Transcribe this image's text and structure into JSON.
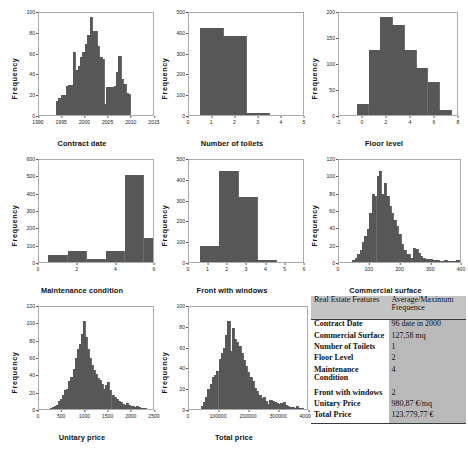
{
  "chart_data": [
    {
      "id": "contract-date",
      "type": "bar",
      "title": "",
      "xlabel": "Contract date",
      "ylabel": "Frequency",
      "ylim": [
        0,
        100
      ],
      "yticks": [
        0,
        20,
        40,
        60,
        80,
        100
      ],
      "xlim": [
        1990,
        2010
      ],
      "xticks": [
        "1990",
        "1995",
        "2000",
        "2005",
        "2010",
        "2015"
      ],
      "xtick_values": [
        1990,
        1994,
        1998,
        2002,
        2006,
        2010
      ],
      "grid": false,
      "bin_start": 1993.0,
      "bin_width": 0.42,
      "values": [
        14,
        17,
        20,
        20,
        28,
        29,
        29,
        62,
        44,
        48,
        57,
        62,
        70,
        78,
        96,
        82,
        82,
        68,
        57,
        55,
        11,
        27,
        27,
        27,
        28,
        42,
        58,
        35,
        30,
        22,
        21
      ]
    },
    {
      "id": "number-of-toilets",
      "type": "bar",
      "title": "",
      "xlabel": "Number of toilets",
      "ylabel": "Frequency",
      "ylim": [
        0,
        500
      ],
      "yticks": [
        0,
        100,
        200,
        300,
        400,
        500
      ],
      "xlim": [
        0,
        5
      ],
      "xticks": [
        "0",
        "1",
        "2",
        "3",
        "4",
        "5"
      ],
      "xtick_values": [
        0,
        1,
        2,
        3,
        4,
        5
      ],
      "grid": false,
      "bin_start": 0.5,
      "bin_width": 1,
      "values": [
        428,
        385,
        10,
        2
      ]
    },
    {
      "id": "floor-level",
      "type": "bar",
      "title": "",
      "xlabel": "Floor level",
      "ylabel": "Frequency",
      "ylim": [
        0,
        200
      ],
      "yticks": [
        0,
        50,
        100,
        150,
        200
      ],
      "xlim": [
        -2,
        8
      ],
      "xticks": [
        "-2",
        "0",
        "2",
        "4",
        "6",
        "8"
      ],
      "xtick_values": [
        -2,
        0,
        2,
        4,
        6,
        8
      ],
      "grid": false,
      "bin_start": -0.5,
      "bin_width": 1,
      "values": [
        22,
        127,
        193,
        177,
        127,
        93,
        65,
        10
      ]
    },
    {
      "id": "maintenance-condition",
      "type": "bar",
      "title": "",
      "xlabel": "Maintenance condition",
      "ylabel": "Frequency",
      "ylim": [
        0,
        600
      ],
      "yticks": [
        0,
        100,
        200,
        300,
        400,
        500,
        600
      ],
      "xlim": [
        0,
        6
      ],
      "xticks": [
        "0",
        "2",
        "4",
        "6"
      ],
      "xtick_values": [
        0,
        2,
        4,
        6
      ],
      "grid": false,
      "bin_start": 0.5,
      "bin_width": 1,
      "values": [
        42,
        63,
        16,
        62,
        510,
        140
      ]
    },
    {
      "id": "front-with-windows",
      "type": "bar",
      "title": "",
      "xlabel": "Front with windows",
      "ylabel": "Frequency",
      "ylim": [
        0,
        500
      ],
      "yticks": [
        0,
        100,
        200,
        300,
        400,
        500
      ],
      "xlim": [
        0,
        6
      ],
      "xticks": [
        "0",
        "1",
        "2",
        "3",
        "4",
        "5",
        "6"
      ],
      "xtick_values": [
        0,
        1,
        2,
        3,
        4,
        5,
        6
      ],
      "grid": false,
      "bin_start": 0.6,
      "bin_width": 1,
      "values": [
        78,
        445,
        320,
        12
      ]
    },
    {
      "id": "commercial-surface",
      "type": "bar",
      "title": "",
      "xlabel": "Commercial surface",
      "ylabel": "Frequency",
      "ylim": [
        0,
        120
      ],
      "yticks": [
        0,
        20,
        40,
        60,
        80,
        100,
        120
      ],
      "xlim": [
        0,
        400
      ],
      "xticks": [
        "0",
        "100",
        "200",
        "300",
        "400"
      ],
      "xtick_values": [
        0,
        100,
        200,
        300,
        400
      ],
      "grid": false,
      "bin_start": 44,
      "bin_width": 8,
      "values": [
        2,
        5,
        9,
        14,
        23,
        31,
        39,
        58,
        80,
        78,
        101,
        107,
        80,
        93,
        78,
        66,
        58,
        50,
        42,
        33,
        21,
        14,
        9,
        10,
        5,
        16,
        15,
        11,
        7,
        5,
        4,
        3,
        3,
        2,
        2,
        2,
        1,
        1,
        2,
        1,
        1,
        1,
        1,
        2,
        1
      ]
    },
    {
      "id": "unitary-price",
      "type": "bar",
      "title": "",
      "xlabel": "Unitary price",
      "ylabel": "Frequency",
      "ylim": [
        0,
        120
      ],
      "yticks": [
        0,
        20,
        40,
        60,
        80,
        100,
        120
      ],
      "xlim": [
        0,
        2500
      ],
      "xticks": [
        "0",
        "500",
        "1000",
        "1500",
        "2000",
        "2500"
      ],
      "xtick_values": [
        0,
        500,
        1000,
        1500,
        2000,
        2500
      ],
      "grid": false,
      "bin_start": 240,
      "bin_width": 45,
      "values": [
        1,
        2,
        3,
        5,
        9,
        12,
        16,
        22,
        24,
        33,
        38,
        47,
        60,
        71,
        77,
        88,
        104,
        85,
        71,
        60,
        52,
        46,
        41,
        36,
        34,
        29,
        23,
        28,
        32,
        22,
        17,
        14,
        12,
        9,
        8,
        6,
        5,
        7,
        5,
        4,
        3,
        2,
        3,
        2,
        1,
        1,
        1
      ]
    },
    {
      "id": "total-price",
      "type": "bar",
      "title": "",
      "xlabel": "Total price",
      "ylabel": "Frequency",
      "ylim": [
        0,
        100
      ],
      "yticks": [
        0,
        20,
        40,
        60,
        80,
        100
      ],
      "xlim": [
        0,
        400000
      ],
      "xticks": [
        "0",
        "100000",
        "200000",
        "300000",
        "400000"
      ],
      "xtick_values": [
        0,
        100000,
        200000,
        300000,
        400000
      ],
      "grid": false,
      "bin_start": 40000,
      "bin_width": 7500,
      "values": [
        3,
        7,
        12,
        20,
        25,
        31,
        33,
        37,
        49,
        55,
        60,
        73,
        86,
        57,
        79,
        69,
        66,
        62,
        55,
        48,
        42,
        36,
        31,
        27,
        21,
        18,
        14,
        11,
        12,
        8,
        5,
        9,
        8,
        7,
        6,
        5,
        6,
        7,
        4,
        3,
        2,
        2,
        1,
        3,
        1,
        1
      ]
    }
  ],
  "summary_table": {
    "header": {
      "feature": "Real Estate Features",
      "value": "Average/Maximum Frequence"
    },
    "rows": [
      {
        "feature": "Contract Date",
        "value": "96 date in 2000"
      },
      {
        "feature": "Commercial Surface",
        "value": "127,58 mq"
      },
      {
        "feature": "Number of Toilets",
        "value": "1"
      },
      {
        "feature": "Floor Level",
        "value": "2"
      },
      {
        "feature": "Maintenance Condition",
        "value": "4"
      },
      {
        "feature": "Front with windows",
        "value": "2"
      },
      {
        "feature": "Unitary Price",
        "value": "980,87 €/mq"
      },
      {
        "feature": "Total Price",
        "value": "123.779,77 €"
      }
    ]
  },
  "colors": {
    "bar": "#575757",
    "table_header_bg": "#c4c4c4",
    "table_value_bg": "#b9b9b9",
    "table_feature_bg": "#ffffff",
    "page_bg": "#ffffff"
  }
}
